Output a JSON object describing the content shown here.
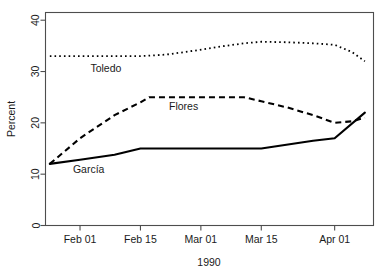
{
  "chart_data": {
    "type": "line",
    "title": "",
    "xlabel": "1990",
    "ylabel": "Percent",
    "ylim": [
      0,
      41.5
    ],
    "yticks": [
      0,
      10,
      20,
      30,
      40
    ],
    "ytick_labels": [
      "0",
      "10",
      "20",
      "30",
      "40"
    ],
    "xlim": [
      24,
      100
    ],
    "xticks": [
      32,
      46,
      60,
      74,
      91
    ],
    "xtick_labels": [
      "Feb 01",
      "Feb 15",
      "Mar 01",
      "Mar 15",
      "Apr 01"
    ],
    "grid": false,
    "legend": "inline-annotations",
    "series": [
      {
        "name": "Toledo",
        "style": "dotted",
        "label_x": 38,
        "label_y": 30.0,
        "x": [
          25,
          32,
          40,
          46,
          52,
          58,
          64,
          70,
          74,
          80,
          86,
          91,
          95,
          98
        ],
        "values": [
          33.0,
          33.0,
          33.0,
          33.0,
          33.3,
          34.0,
          34.8,
          35.5,
          35.8,
          35.7,
          35.5,
          35.2,
          33.8,
          32.0
        ]
      },
      {
        "name": "Flores",
        "style": "dashed",
        "label_x": 56,
        "label_y": 22.5,
        "x": [
          25,
          32,
          40,
          46,
          48,
          54,
          60,
          66,
          70,
          74,
          80,
          86,
          91,
          95,
          98
        ],
        "values": [
          12.0,
          17.0,
          21.5,
          24.0,
          25.0,
          25.0,
          25.0,
          25.0,
          25.0,
          24.2,
          23.0,
          21.5,
          20.0,
          20.3,
          21.0
        ]
      },
      {
        "name": "García",
        "style": "solid",
        "label_x": 34,
        "label_y": 10.2,
        "x": [
          25,
          32,
          40,
          46,
          54,
          60,
          70,
          74,
          86,
          91,
          98
        ],
        "values": [
          12.0,
          12.8,
          13.8,
          15.0,
          15.0,
          15.0,
          15.0,
          15.0,
          16.5,
          17.0,
          22.0
        ]
      }
    ]
  }
}
